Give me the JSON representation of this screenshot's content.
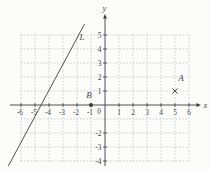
{
  "figure": {
    "width": 210,
    "height": 170,
    "bg_color": "#fcfcfa",
    "axis_color": "#3d3d3f",
    "grid_color": "#c1c1c5",
    "text_color": "#474749",
    "origin_px": {
      "x": 105,
      "y": 105
    },
    "unit_px": 14,
    "x_axis_start_px": 10,
    "x_axis_end_px": 198,
    "x_arrow_tip_px": 201,
    "y_axis_bottom_px": 166,
    "y_axis_top_px": 18,
    "y_arrow_tip_px": 14
  },
  "chart_data": {
    "type": "line",
    "title": "",
    "xlabel": "x",
    "ylabel": "y",
    "xlim": [
      -6,
      6
    ],
    "ylim": [
      -4,
      5
    ],
    "grid": true,
    "origin_label": "0",
    "x_ticks": [
      {
        "value": -6,
        "label": "-6"
      },
      {
        "value": -5,
        "label": "-5"
      },
      {
        "value": -4,
        "label": "-4"
      },
      {
        "value": -3,
        "label": "-3"
      },
      {
        "value": -2,
        "label": "-2"
      },
      {
        "value": -1,
        "label": "-1"
      },
      {
        "value": 1,
        "label": "1"
      },
      {
        "value": 2,
        "label": "2"
      },
      {
        "value": 3,
        "label": "3"
      },
      {
        "value": 4,
        "label": "4"
      },
      {
        "value": 5,
        "label": "5"
      },
      {
        "value": 6,
        "label": "6"
      }
    ],
    "y_ticks": [
      {
        "value": 5,
        "label": "5"
      },
      {
        "value": 4,
        "label": "4"
      },
      {
        "value": 3,
        "label": "3"
      },
      {
        "value": 2,
        "label": "2"
      },
      {
        "value": 1,
        "label": "1"
      },
      {
        "value": -2,
        "label": "-2"
      },
      {
        "value": -3,
        "label": "-3"
      },
      {
        "value": -4,
        "label": "-4"
      }
    ],
    "series": [
      {
        "name": "L",
        "kind": "straight-line",
        "slope_approx": 1.9,
        "x_intercept_approx": -4.5,
        "points": [
          {
            "x": -6.9,
            "y": -4.35
          },
          {
            "x": -1.45,
            "y": 5.8
          }
        ],
        "label": "L",
        "label_pos": {
          "x": -1.64,
          "y": 4.85
        }
      }
    ],
    "points": [
      {
        "label": "A",
        "x": 5,
        "y": 1,
        "marker": "cross",
        "label_offset_px": {
          "dx": 6,
          "dy": -10
        }
      },
      {
        "label": "B",
        "x": -1,
        "y": 0,
        "marker": "dot",
        "label_offset_px": {
          "dx": -2,
          "dy": -7
        }
      }
    ]
  }
}
